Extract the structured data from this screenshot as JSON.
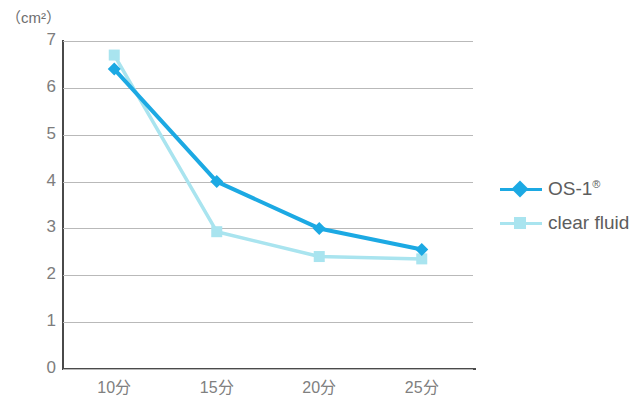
{
  "chart_data": {
    "type": "line",
    "title": "",
    "xlabel": "",
    "ylabel": "(cm²)",
    "unit_label": "（cm²）",
    "categories": [
      "10分",
      "15分",
      "20分",
      "25分"
    ],
    "ylim": [
      0,
      7
    ],
    "yticks": [
      "0",
      "1",
      "2",
      "3",
      "4",
      "5",
      "6",
      "7"
    ],
    "grid": true,
    "legend_position": "right",
    "series": [
      {
        "name": "OS-1®",
        "label_text": "OS-1",
        "label_sup": "®",
        "color": "#1CA9E3",
        "marker": "diamond",
        "values": [
          6.4,
          4.0,
          3.0,
          2.55
        ]
      },
      {
        "name": "clear fluid",
        "label_text": "clear fluid",
        "label_sup": "",
        "color": "#A9E4EF",
        "marker": "square",
        "values": [
          6.7,
          2.93,
          2.4,
          2.35
        ]
      }
    ]
  },
  "axis": {
    "line_color": "#4a4a4a",
    "grid_color": "#b9b9b9",
    "tick_text_color": "#808080"
  }
}
